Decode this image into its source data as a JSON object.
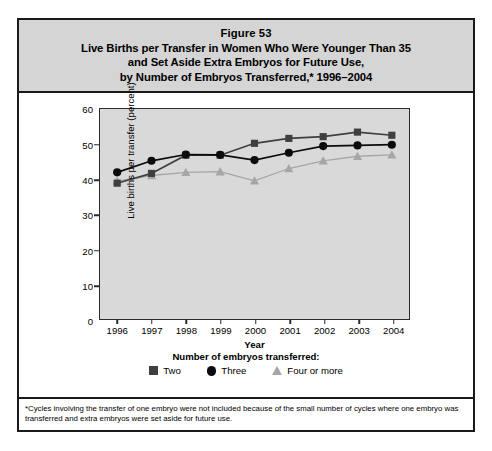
{
  "figure": {
    "title_lines": [
      "Figure 53",
      "Live Births per Transfer in Women Who Were Younger Than 35",
      "and Set Aside Extra Embryos for Future Use,",
      "by Number of Embryos Transferred,* 1996–2004"
    ],
    "footnote": "*Cycles involving the transfer of one embryo were not included because of the small number of cycles where one embryo was transferred and extra embryos were set aside for future use."
  },
  "legend": {
    "title": "Number of embryos transferred:",
    "items": [
      {
        "label": "Two",
        "marker": "square-marker-icon",
        "color": "#3f3f3f"
      },
      {
        "label": "Three",
        "marker": "circle-marker-icon",
        "color": "#0b0b0b"
      },
      {
        "label": "Four or more",
        "marker": "triangle-marker-icon",
        "color": "#a6a6a6"
      }
    ]
  },
  "chart_data": {
    "type": "line",
    "title": "Live Births per Transfer in Women Who Were Younger Than 35 and Set Aside Extra Embryos for Future Use, by Number of Embryos Transferred,* 1996–2004",
    "xlabel": "Year",
    "ylabel": "Live births per transfer (percent)",
    "categories": [
      "1996",
      "1997",
      "1998",
      "1999",
      "2000",
      "2001",
      "2002",
      "2003",
      "2004"
    ],
    "x": [
      1996,
      1997,
      1998,
      1999,
      2000,
      2001,
      2002,
      2003,
      2004
    ],
    "ylim": [
      0,
      60
    ],
    "yticks": [
      0,
      10,
      20,
      30,
      40,
      50,
      60
    ],
    "grid": false,
    "legend_position": "bottom",
    "plot_background": "#d9d9d9",
    "series": [
      {
        "name": "Two",
        "marker": "square",
        "color": "#3f3f3f",
        "values": [
          38.8,
          41.6,
          46.8,
          46.8,
          50.2,
          51.6,
          52.1,
          53.4,
          52.5
        ]
      },
      {
        "name": "Three",
        "marker": "circle",
        "color": "#0b0b0b",
        "values": [
          41.9,
          45.2,
          47.0,
          46.9,
          45.4,
          47.5,
          49.4,
          49.6,
          49.8
        ]
      },
      {
        "name": "Four or more",
        "marker": "triangle",
        "color": "#a6a6a6",
        "values": [
          39.4,
          41.0,
          41.9,
          42.1,
          39.5,
          43.0,
          45.2,
          46.5,
          46.9
        ]
      }
    ]
  }
}
